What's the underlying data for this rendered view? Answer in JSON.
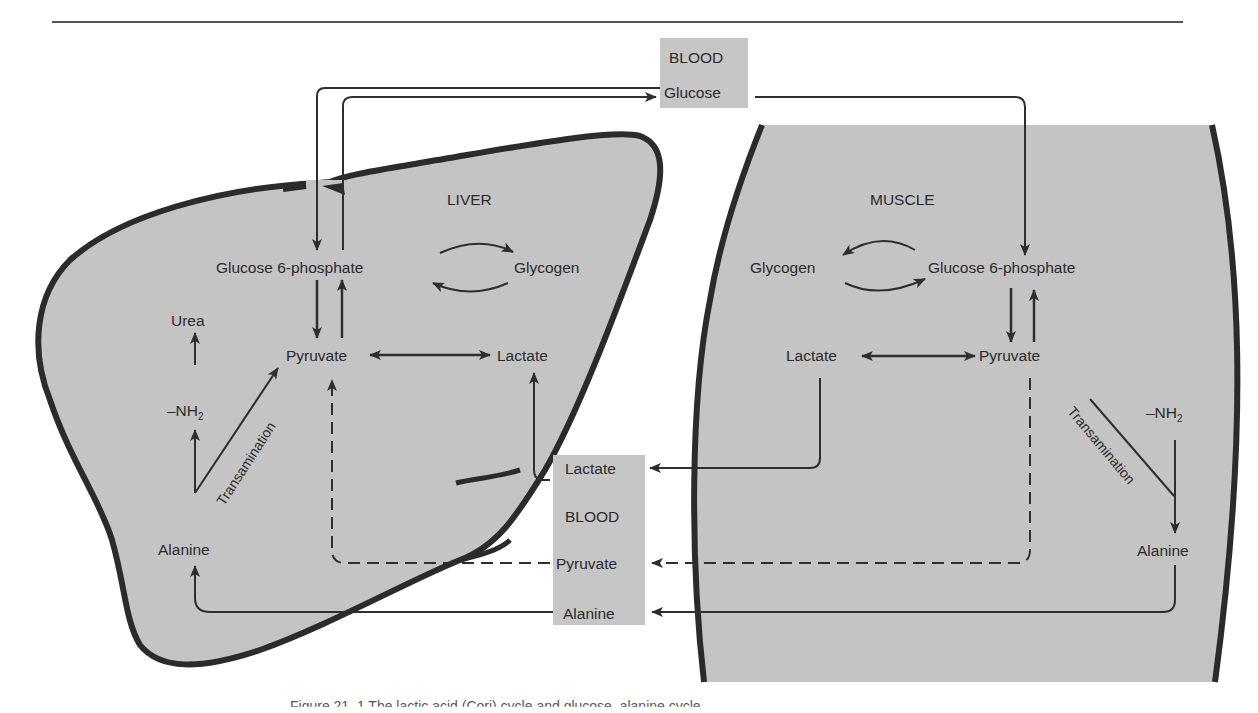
{
  "figure": {
    "rule": {
      "x1": 52,
      "x2": 1183,
      "y": 22
    },
    "colors": {
      "organ_fill": "#c4c4c4",
      "organ_outline": "#2b2b2b",
      "blood_fill": "#c6c6c6",
      "arrow": "#2e2e2e",
      "text": "#2b2b2b"
    },
    "caption": "Figure 21–1  The lactic acid (Cori) cycle and glucose–alanine cycle"
  },
  "blood_top": {
    "title": "BLOOD",
    "item": "Glucose"
  },
  "liver": {
    "title": "LIVER",
    "glucose6p": "Glucose 6-phosphate",
    "glycogen": "Glycogen",
    "pyruvate": "Pyruvate",
    "lactate": "Lactate",
    "urea": "Urea",
    "nh2": "–NH",
    "nh2_sub": "2",
    "transamination": "Transamination",
    "alanine": "Alanine"
  },
  "muscle": {
    "title": "MUSCLE",
    "glycogen": "Glycogen",
    "glucose6p": "Glucose 6-phosphate",
    "lactate": "Lactate",
    "pyruvate": "Pyruvate",
    "nh2": "–NH",
    "nh2_sub": "2",
    "transamination": "Transamination",
    "alanine": "Alanine"
  },
  "blood_bottom": {
    "title": "BLOOD",
    "items": [
      "Lactate",
      "Pyruvate",
      "Alanine"
    ]
  }
}
